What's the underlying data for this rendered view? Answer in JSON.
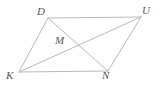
{
  "figure": {
    "type": "geometry-diagram",
    "shape": "parallelogram-with-diagonals",
    "name": "DUNK",
    "background_color": "#ffffff",
    "line_color": "#b9b9bb",
    "label_color": "#58585a",
    "line_width": 1,
    "vertices": [
      {
        "id": "D",
        "label": "D",
        "x": 48,
        "y": 18,
        "label_x": 37,
        "label_y": 6
      },
      {
        "id": "U",
        "label": "U",
        "x": 141,
        "y": 17,
        "label_x": 142,
        "label_y": 5
      },
      {
        "id": "N",
        "label": "N",
        "x": 108,
        "y": 71,
        "label_x": 102,
        "label_y": 70
      },
      {
        "id": "K",
        "label": "K",
        "x": 19,
        "y": 72,
        "label_x": 6,
        "label_y": 70
      },
      {
        "id": "M",
        "label": "M",
        "x": 73,
        "y": 45,
        "label_x": 55,
        "label_y": 35
      }
    ],
    "sides": [
      {
        "name": "side-DU",
        "from": "D",
        "to": "U"
      },
      {
        "name": "side-UN",
        "from": "U",
        "to": "N"
      },
      {
        "name": "side-NK",
        "from": "N",
        "to": "K"
      },
      {
        "name": "side-KD",
        "from": "K",
        "to": "D"
      }
    ],
    "diagonals": [
      {
        "name": "diagonal-DN",
        "from": "D",
        "to": "N"
      },
      {
        "name": "diagonal-KU",
        "from": "K",
        "to": "U"
      }
    ],
    "intersection_label": "M"
  }
}
